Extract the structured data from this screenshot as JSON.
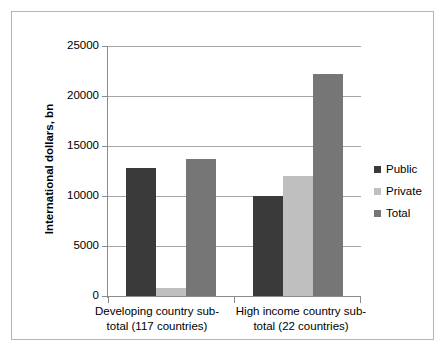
{
  "chart_data": {
    "type": "bar",
    "title": "",
    "xlabel": "",
    "ylabel": "International dollars, bn",
    "ylim": [
      0,
      25000
    ],
    "ytick_labels": [
      "0",
      "5000",
      "10000",
      "15000",
      "20000",
      "25000"
    ],
    "ytick_values": [
      0,
      5000,
      10000,
      15000,
      20000,
      25000
    ],
    "grid": true,
    "legend_position": "right",
    "categories": [
      "Developing country sub-\ntotal (117 countries)",
      "High income country sub-\ntotal (22 countries)"
    ],
    "series": [
      {
        "name": "Public",
        "color": "#3a3a3a",
        "values": [
          12800,
          10000
        ]
      },
      {
        "name": "Private",
        "color": "#bfbfbf",
        "values": [
          800,
          12000
        ]
      },
      {
        "name": "Total",
        "color": "#767676",
        "values": [
          13700,
          22200
        ]
      }
    ]
  },
  "legend": {
    "items": [
      {
        "label": "Public",
        "color": "#3a3a3a"
      },
      {
        "label": "Private",
        "color": "#bfbfbf"
      },
      {
        "label": "Total",
        "color": "#767676"
      }
    ]
  },
  "colors": {
    "public": "#3a3a3a",
    "private": "#bfbfbf",
    "total": "#767676",
    "gridline": "#a6a6a6",
    "axis": "#8c8c8c",
    "frame_border": "#b4b4b4",
    "background": "#ffffff",
    "text": "#000000"
  }
}
